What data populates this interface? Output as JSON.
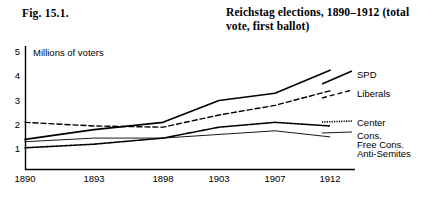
{
  "figure": {
    "caption": "Fig. 15.1.",
    "title": "Reichstag elections, 1890–1912 (total vote, first ballot)"
  },
  "axes": {
    "y_title": "Millions of voters",
    "y_ticks": [
      "1",
      "2",
      "3",
      "4",
      "5"
    ],
    "x_ticks": [
      "1890",
      "1893",
      "1898",
      "1903",
      "1907",
      "1912"
    ]
  },
  "legend": {
    "entries": [
      {
        "label": "SPD",
        "style": "solid-thick",
        "color": "#000000"
      },
      {
        "label": "Liberals",
        "style": "dashed",
        "color": "#000000"
      },
      {
        "label": "Center",
        "style": "dotted",
        "color": "#000000"
      },
      {
        "label": "Cons.",
        "style": "solid-thin",
        "color": "#000000"
      },
      {
        "label": "Free Cons.",
        "style": "solid-thin",
        "color": "#000000"
      },
      {
        "label": "Anti-Semites",
        "style": "solid-thin",
        "color": "#000000"
      }
    ]
  },
  "chart_data": {
    "type": "line",
    "title": "Reichstag elections, 1890–1912 (total vote, first ballot)",
    "xlabel": "",
    "ylabel": "Millions of voters",
    "categories": [
      "1890",
      "1893",
      "1898",
      "1903",
      "1907",
      "1912"
    ],
    "x": [
      1890,
      1893,
      1898,
      1903,
      1907,
      1912
    ],
    "ylim": [
      0,
      5
    ],
    "xlim": [
      1890,
      1912
    ],
    "grid": false,
    "legend_position": "right",
    "units": "millions of voters",
    "series": [
      {
        "name": "SPD",
        "style": "solid-thick",
        "values": [
          1.4,
          1.8,
          2.1,
          3.0,
          3.3,
          4.25
        ]
      },
      {
        "name": "Liberals",
        "style": "dashed",
        "values": [
          2.1,
          1.95,
          1.9,
          2.4,
          2.8,
          3.4
        ]
      },
      {
        "name": "Center",
        "style": "dotted",
        "values": [
          1.05,
          1.2,
          1.45,
          1.9,
          2.1,
          1.95
        ]
      },
      {
        "name": "Cons., Free Cons., Anti-Semites",
        "style": "solid-thin",
        "values": [
          1.3,
          1.45,
          1.45,
          1.6,
          1.75,
          1.5
        ]
      }
    ]
  }
}
